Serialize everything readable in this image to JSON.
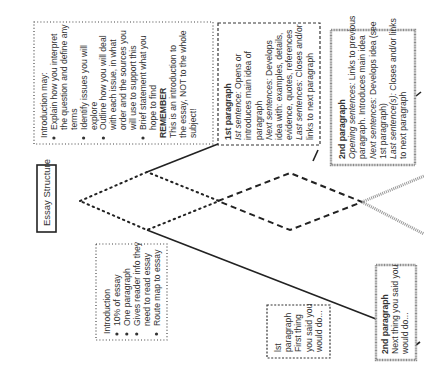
{
  "title": "Essay Structure",
  "colors": {
    "ink": "#333333",
    "line": "#222222",
    "grey_border": "#888888",
    "background": "#ffffff"
  },
  "intro_detail": {
    "heading": "Introduction may:",
    "lines": [
      {
        "bullet": true,
        "text": "Explain how you interpret"
      },
      {
        "bullet": false,
        "text": "the question and define any"
      },
      {
        "bullet": false,
        "text": "terms"
      },
      {
        "bullet": true,
        "text": "Identify issues you will"
      },
      {
        "bullet": false,
        "text": "explore"
      },
      {
        "bullet": true,
        "text": "Outline how you will deal"
      },
      {
        "bullet": false,
        "text": "with each issue,  in what"
      },
      {
        "bullet": false,
        "text": "order and the sources you"
      },
      {
        "bullet": false,
        "text": "will use to support this"
      },
      {
        "bullet": true,
        "text": "Brief statement what you"
      },
      {
        "bullet": false,
        "text": "hope to find"
      }
    ],
    "remember_label": "REMEMBER",
    "remember_lines": [
      "This is an introduction to",
      "the essay, NOT to the whole",
      "subject!"
    ]
  },
  "intro_summary": {
    "heading": "Introduction",
    "lines": [
      {
        "bullet": true,
        "text": "10% of essay"
      },
      {
        "bullet": true,
        "text": "One paragraph"
      },
      {
        "bullet": true,
        "text": "Gives reader info they"
      },
      {
        "bullet": false,
        "text": "need to read essay"
      },
      {
        "bullet": true,
        "text": "Route map to essay"
      }
    ]
  },
  "para1_detail": {
    "heading": "1st paragraph",
    "lines": [
      {
        "italic": "Ist sentence:",
        "rest": " Opens or"
      },
      {
        "italic": "",
        "rest": "introduces main idea of"
      },
      {
        "italic": "",
        "rest": "paragraph"
      },
      {
        "italic": "Next sentences:",
        "rest": " Develops"
      },
      {
        "italic": "",
        "rest": "idea with: examples, details,"
      },
      {
        "italic": "",
        "rest": "evidence, quotes, references"
      },
      {
        "italic": "Last sentences:",
        "rest": " Closes and/or"
      },
      {
        "italic": "",
        "rest": "links to next paragraph"
      }
    ]
  },
  "para1_summary": {
    "lines": [
      "lst",
      "paragraph",
      "First thing",
      "you said you",
      "would do..."
    ]
  },
  "para2_detail": {
    "heading": "2nd paragraph",
    "lines": [
      {
        "italic": "Opening sentences:",
        "rest": " Links to previous"
      },
      {
        "italic": "",
        "rest": "paragraph. Introduces main idea"
      },
      {
        "italic": "Next sentences:",
        "rest": " Develops idea (see"
      },
      {
        "italic": "",
        "rest": "1st paragraph)"
      },
      {
        "italic": "Last sentence(s):",
        "rest": " Closes and/or links"
      },
      {
        "italic": "",
        "rest": "to next paragraph"
      }
    ]
  },
  "para2_summary": {
    "heading": "2nd paragraph",
    "lines": [
      "Next thing you said you",
      "would do..."
    ]
  }
}
